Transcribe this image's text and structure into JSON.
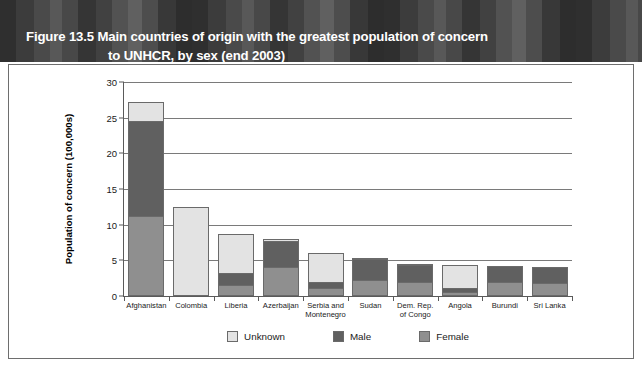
{
  "figure": {
    "title_line1": "Figure 13.5 Main countries of origin with the greatest population of concern",
    "title_line2": "to UNHCR, by sex (end 2003)"
  },
  "colors": {
    "unknown": "#e3e3e3",
    "male": "#606060",
    "female": "#8f8f8f",
    "banner": "#3a3a3a",
    "grid": "#7a7a7a",
    "axis": "#5a5a5a",
    "border": "#6e6e6e"
  },
  "chart_data": {
    "type": "bar",
    "stacked": true,
    "title": "Figure 13.5 Main countries of origin with the greatest population of concern to UNHCR, by sex (end 2003)",
    "xlabel": "",
    "ylabel": "Population of concern (100,000s)",
    "ylim": [
      0,
      30
    ],
    "yticks": [
      0,
      5,
      10,
      15,
      20,
      25,
      30
    ],
    "ytick_labels": [
      "0",
      "5",
      "10",
      "15",
      "20",
      "25",
      "30"
    ],
    "grid": true,
    "grid_axis": "y",
    "legend_position": "bottom",
    "categories": [
      "Afghanistan",
      "Colombia",
      "Liberia",
      "Azerbaijan",
      "Serbia and\nMontenegro",
      "Sudan",
      "Dem. Rep.\nof Congo",
      "Angola",
      "Burundi",
      "Sri Lanka"
    ],
    "series": [
      {
        "name": "Female",
        "color": "#8f8f8f",
        "values": [
          11.2,
          0.0,
          1.6,
          4.1,
          1.1,
          2.2,
          1.9,
          0.5,
          2.0,
          1.8
        ]
      },
      {
        "name": "Male",
        "color": "#606060",
        "values": [
          13.4,
          0.0,
          1.6,
          3.6,
          0.8,
          3.0,
          2.4,
          0.6,
          2.2,
          2.3
        ]
      },
      {
        "name": "Unknown",
        "color": "#e3e3e3",
        "values": [
          2.6,
          12.5,
          5.5,
          0.3,
          4.1,
          0.15,
          0.2,
          3.3,
          0.0,
          0.0
        ]
      }
    ],
    "totals": [
      27.2,
      12.5,
      8.7,
      8.0,
      6.0,
      5.35,
      4.5,
      4.4,
      4.2,
      4.1
    ]
  },
  "legend": {
    "items": [
      {
        "label": "Unknown",
        "color": "#e3e3e3"
      },
      {
        "label": "Male",
        "color": "#606060"
      },
      {
        "label": "Female",
        "color": "#8f8f8f"
      }
    ]
  }
}
